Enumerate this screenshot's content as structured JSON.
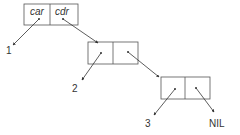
{
  "diagram": {
    "header_labels": {
      "car": "car",
      "cdr": "cdr"
    },
    "cells": [
      {
        "id": "cell1",
        "car_value": "1",
        "cdr_points_to": "cell2"
      },
      {
        "id": "cell2",
        "car_value": "2",
        "cdr_points_to": "cell3"
      },
      {
        "id": "cell3",
        "car_value": "3",
        "cdr_points_to": "NIL"
      }
    ],
    "values": {
      "v1": "1",
      "v2": "2",
      "v3": "3",
      "nil": "NIL"
    },
    "colors": {
      "stroke": "#555555",
      "arrow": "#333333",
      "background": "#ffffff"
    }
  }
}
